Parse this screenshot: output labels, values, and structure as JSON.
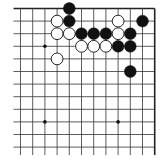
{
  "board": {
    "description": "Top-right corner fragment of a 19x19 Go board",
    "visible_columns": 12,
    "visible_rows": 12,
    "origin_x": 20.5,
    "origin_y": 8.5,
    "spacing_x": 12.2,
    "spacing_y": 12.6,
    "edges": {
      "top": true,
      "right": true,
      "left": false,
      "bottom": false
    },
    "line_color": "#333333",
    "edge_color": "#222222",
    "background": "#ffffff",
    "hoshi": [
      {
        "col": 2,
        "row": 3
      },
      {
        "col": 8,
        "row": 3
      },
      {
        "col": 2,
        "row": 9
      },
      {
        "col": 8,
        "row": 9
      }
    ],
    "stones": [
      {
        "color": "black",
        "col": 4,
        "row": 0
      },
      {
        "color": "white",
        "col": 3,
        "row": 1
      },
      {
        "color": "black",
        "col": 4,
        "row": 1
      },
      {
        "color": "white",
        "col": 8,
        "row": 1
      },
      {
        "color": "black",
        "col": 10,
        "row": 1
      },
      {
        "color": "white",
        "col": 3,
        "row": 2
      },
      {
        "color": "white",
        "col": 4,
        "row": 2
      },
      {
        "color": "black",
        "col": 5,
        "row": 2
      },
      {
        "color": "black",
        "col": 6,
        "row": 2
      },
      {
        "color": "black",
        "col": 7,
        "row": 2
      },
      {
        "color": "white",
        "col": 8,
        "row": 2
      },
      {
        "color": "black",
        "col": 9,
        "row": 2
      },
      {
        "color": "white",
        "col": 5,
        "row": 3
      },
      {
        "color": "white",
        "col": 6,
        "row": 3
      },
      {
        "color": "white",
        "col": 7,
        "row": 3
      },
      {
        "color": "black",
        "col": 8,
        "row": 3
      },
      {
        "color": "black",
        "col": 9,
        "row": 3
      },
      {
        "color": "white",
        "col": 3,
        "row": 4
      },
      {
        "color": "black",
        "col": 9,
        "row": 5
      }
    ]
  }
}
